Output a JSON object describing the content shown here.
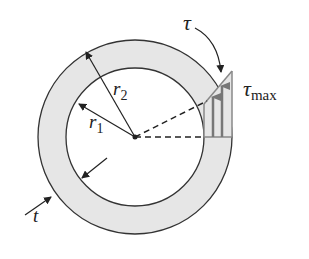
{
  "diagram": {
    "labels": {
      "outer_radius": {
        "symbol": "r",
        "subscript": "2"
      },
      "inner_radius": {
        "symbol": "r",
        "subscript": "1"
      },
      "thickness": {
        "symbol": "t"
      },
      "shear_stress": {
        "symbol": "τ"
      },
      "max_shear_stress": {
        "symbol": "τ",
        "subscript": "max"
      }
    },
    "colors": {
      "ring_fill": "#e6e6e6",
      "stroke": "#333333",
      "stress_lines": "#888888"
    }
  }
}
